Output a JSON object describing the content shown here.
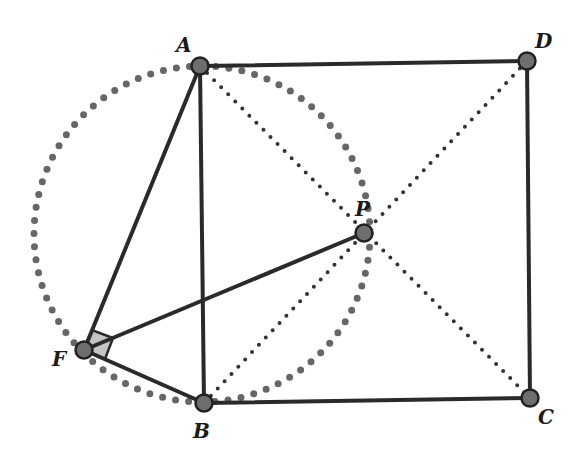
{
  "diagram": {
    "points": {
      "A": {
        "label": "A",
        "x": 200,
        "y": 66,
        "lx": 176,
        "ly": 52
      },
      "B": {
        "label": "B",
        "x": 204,
        "y": 403,
        "lx": 193,
        "ly": 438
      },
      "C": {
        "label": "C",
        "x": 530,
        "y": 398,
        "lx": 538,
        "ly": 424
      },
      "D": {
        "label": "D",
        "x": 527,
        "y": 61,
        "lx": 535,
        "ly": 48
      },
      "P": {
        "label": "P",
        "x": 364,
        "y": 233,
        "lx": 355,
        "ly": 214
      },
      "F": {
        "label": "F",
        "x": 84,
        "y": 350,
        "lx": 52,
        "ly": 366
      }
    },
    "circle": {
      "cx": 202,
      "cy": 234,
      "r": 168,
      "style": "dotted"
    },
    "solid_segments": [
      "AD",
      "DC",
      "CB",
      "BA",
      "AF",
      "FB",
      "FP"
    ],
    "dotted_segments": [
      "AC",
      "BD"
    ],
    "right_angle_mark": {
      "at": "F",
      "fill": "#c4c4c4"
    },
    "colors": {
      "line": "#2a2a2a",
      "point_fill": "#6e6e6e",
      "point_stroke": "#222222",
      "circle_dots": "#666666",
      "diagonal_dots": "#333333"
    }
  }
}
